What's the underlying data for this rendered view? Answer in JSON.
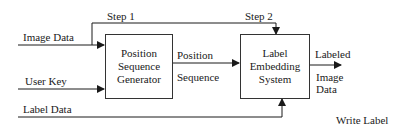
{
  "diagram": {
    "inputs": {
      "image_data": "Image Data",
      "user_key": "User Key",
      "label_data": "Label Data"
    },
    "steps": {
      "step1": "Step 1",
      "step2": "Step 2"
    },
    "blocks": [
      {
        "id": "psg",
        "lines": [
          "Position",
          "Sequence",
          "Generator"
        ]
      },
      {
        "id": "les",
        "lines": [
          "Label",
          "Embedding",
          "System"
        ]
      }
    ],
    "edges": {
      "position_sequence": [
        "Position",
        "Sequence"
      ],
      "output": [
        "Labeled",
        "Image",
        "Data"
      ]
    },
    "caption": "Write Label",
    "colors": {
      "line": "#1a1a1a",
      "box_border": "#333333",
      "background": "#ffffff"
    }
  }
}
